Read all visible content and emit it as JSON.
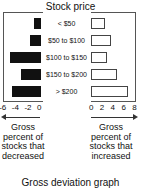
{
  "chart_data": {
    "type": "bar",
    "title": "Stock price",
    "caption": "Gross deviation graph",
    "categories": [
      "< $50",
      "$50 to $100",
      "$100 to $150",
      "$150 to $200",
      "> $200"
    ],
    "series": [
      {
        "name": "Gross percent of stocks that decreased",
        "values": [
          -1.1,
          -1.7,
          -4.9,
          -3.2,
          -4.6
        ],
        "color": "#111111"
      },
      {
        "name": "Gross percent of stocks that increased",
        "values": [
          2.4,
          3.5,
          2.8,
          4.6,
          6.6
        ],
        "color": "#ffffff"
      }
    ],
    "left_axis": {
      "ticks": [
        "-6",
        "-4",
        "-2",
        "0"
      ],
      "range": [
        -6,
        0
      ],
      "label": "Gross percent of stocks that decreased"
    },
    "right_axis": {
      "ticks": [
        "0",
        "2",
        "4",
        "6",
        "8"
      ],
      "range": [
        0,
        8
      ],
      "label": "Gross percent of stocks that increased"
    },
    "grid": false
  },
  "labels": {
    "title": "Stock price",
    "left_lines": [
      "Gross",
      "percent of",
      "stocks that",
      "decreased"
    ],
    "right_lines": [
      "Gross",
      "percent of",
      "stocks that",
      "increased"
    ],
    "footer": "Gross deviation graph"
  }
}
